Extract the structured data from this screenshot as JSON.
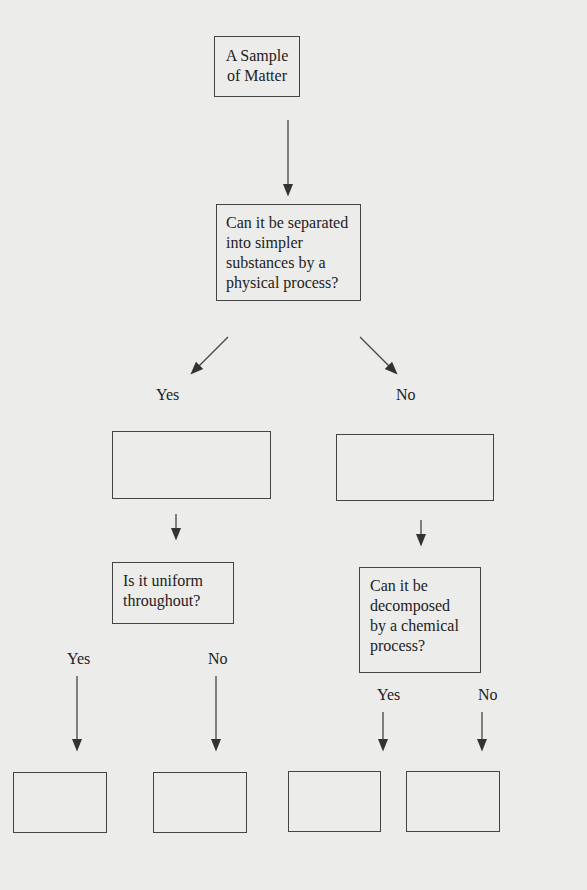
{
  "root": {
    "line1": "A Sample",
    "line2": "of Matter"
  },
  "q1": {
    "lines": [
      "Can it be separated",
      "into simpler",
      "substances by  a",
      "physical process?"
    ]
  },
  "q1_branches": {
    "yes": "Yes",
    "no": "No"
  },
  "q2": {
    "lines": [
      "Is it uniform",
      "throughout?"
    ]
  },
  "q2_branches": {
    "yes": "Yes",
    "no": "No"
  },
  "q3": {
    "lines": [
      "Can it be",
      "decomposed",
      "by a chemical",
      "process?"
    ]
  },
  "q3_branches": {
    "yes": "Yes",
    "no": "No"
  },
  "colors": {
    "line": "#444444",
    "background": "#ececea"
  }
}
